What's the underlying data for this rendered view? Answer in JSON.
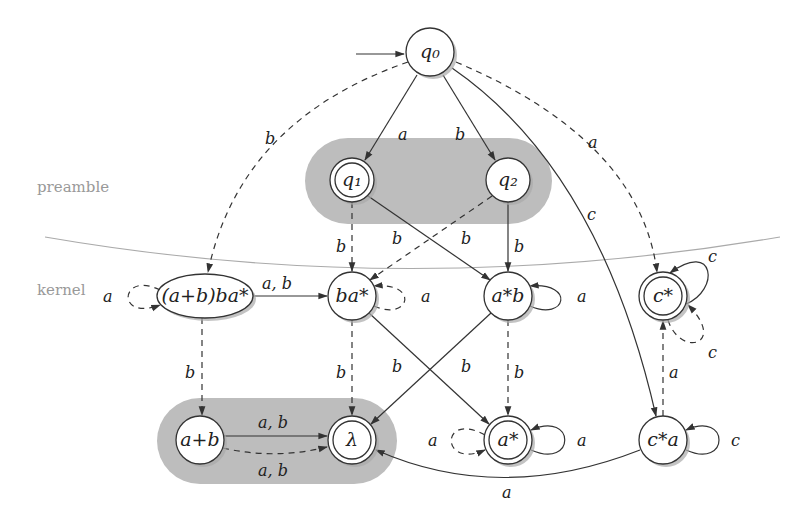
{
  "diagram": {
    "title": "",
    "regions": {
      "preamble": "preamble",
      "kernel": "kernel"
    },
    "colors": {
      "group_fill": "#bdbdbd",
      "separator": "#aaaaaa",
      "stroke": "#333333"
    },
    "nodes": [
      {
        "id": "q0",
        "label": "q₀",
        "initial": true,
        "accepting": false
      },
      {
        "id": "q1",
        "label": "q₁",
        "initial": false,
        "accepting": true
      },
      {
        "id": "q2",
        "label": "q₂",
        "initial": false,
        "accepting": false
      },
      {
        "id": "abba",
        "label": "(a+b)ba*",
        "initial": false,
        "accepting": false
      },
      {
        "id": "ba",
        "label": "ba*",
        "initial": false,
        "accepting": false
      },
      {
        "id": "ab",
        "label": "a*b",
        "initial": false,
        "accepting": false
      },
      {
        "id": "cs",
        "label": "c*",
        "initial": false,
        "accepting": true
      },
      {
        "id": "apb",
        "label": "a+b",
        "initial": false,
        "accepting": false
      },
      {
        "id": "lambda",
        "label": "λ",
        "initial": false,
        "accepting": true
      },
      {
        "id": "as",
        "label": "a*",
        "initial": false,
        "accepting": true
      },
      {
        "id": "ca",
        "label": "c*a",
        "initial": false,
        "accepting": false
      }
    ],
    "edges": [
      {
        "from": "q0",
        "to": "q1",
        "label": "a",
        "style": "solid"
      },
      {
        "from": "q0",
        "to": "q2",
        "label": "b",
        "style": "solid"
      },
      {
        "from": "q0",
        "to": "abba",
        "label": "b",
        "style": "dashed"
      },
      {
        "from": "q0",
        "to": "ca",
        "label": "c",
        "style": "solid"
      },
      {
        "from": "q0",
        "to": "cs",
        "label": "a",
        "style": "dashed"
      },
      {
        "from": "q1",
        "to": "ba",
        "label": "b",
        "style": "dashed"
      },
      {
        "from": "q1",
        "to": "ab",
        "label": "b",
        "style": "solid"
      },
      {
        "from": "q2",
        "to": "ba",
        "label": "b",
        "style": "dashed"
      },
      {
        "from": "q2",
        "to": "ab",
        "label": "b",
        "style": "solid"
      },
      {
        "from": "abba",
        "to": "abba",
        "label": "a",
        "style": "dashed"
      },
      {
        "from": "abba",
        "to": "ba",
        "label": "a, b",
        "style": "solid"
      },
      {
        "from": "abba",
        "to": "apb",
        "label": "b",
        "style": "dashed"
      },
      {
        "from": "ba",
        "to": "ba",
        "label": "a",
        "style": "dashed"
      },
      {
        "from": "ba",
        "to": "lambda",
        "label": "b",
        "style": "dashed"
      },
      {
        "from": "ba",
        "to": "as",
        "label": "b",
        "style": "solid"
      },
      {
        "from": "ab",
        "to": "ab",
        "label": "a",
        "style": "solid"
      },
      {
        "from": "ab",
        "to": "lambda",
        "label": "b",
        "style": "solid"
      },
      {
        "from": "ab",
        "to": "as",
        "label": "b",
        "style": "dashed"
      },
      {
        "from": "cs",
        "to": "cs",
        "label": "c",
        "style": "solid"
      },
      {
        "from": "cs",
        "to": "cs",
        "label": "c",
        "style": "dashed"
      },
      {
        "from": "apb",
        "to": "lambda",
        "label": "a, b",
        "style": "solid"
      },
      {
        "from": "apb",
        "to": "lambda",
        "label": "a, b",
        "style": "dashed"
      },
      {
        "from": "as",
        "to": "as",
        "label": "a",
        "style": "dashed"
      },
      {
        "from": "as",
        "to": "as",
        "label": "a",
        "style": "solid"
      },
      {
        "from": "ca",
        "to": "ca",
        "label": "c",
        "style": "solid"
      },
      {
        "from": "ca",
        "to": "cs",
        "label": "a",
        "style": "dashed"
      },
      {
        "from": "ca",
        "to": "lambda",
        "label": "a",
        "style": "solid"
      }
    ],
    "labels": {
      "q0_q1": "a",
      "q0_q2": "b",
      "q0_abba": "b",
      "q0_ca": "c",
      "q0_cs": "a",
      "q1_ba": "b",
      "q1_ab": "b",
      "q2_ba": "b",
      "q2_ab": "b",
      "abba_loop": "a",
      "abba_ba": "a, b",
      "abba_apb": "b",
      "ba_loop": "a",
      "ba_lambda": "b",
      "ba_as": "b",
      "ab_loop": "a",
      "ab_lambda": "b",
      "ab_as": "b",
      "cs_loop_solid": "c",
      "cs_loop_dashed": "c",
      "apb_lambda_solid": "a, b",
      "apb_lambda_dashed": "a, b",
      "as_loop_dashed": "a",
      "as_loop_solid": "a",
      "ca_loop": "c",
      "ca_cs": "a",
      "ca_lambda": "a"
    }
  }
}
